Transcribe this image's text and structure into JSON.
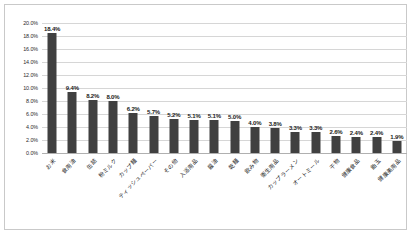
{
  "chart_data": {
    "type": "bar",
    "title": "",
    "subtitle": "",
    "xlabel": "",
    "ylabel": "",
    "ylim": [
      0,
      20
    ],
    "grid": true,
    "legend": false,
    "legend_position": "none",
    "bar_color": "#404040",
    "gridline_color": "#d6d6d6",
    "border_color": "#c9c9c9",
    "value_suffix": "%",
    "categories": [
      "お米",
      "食用油",
      "缶詰",
      "粉ミルク",
      "カップ麺",
      "ティッシュペーパー",
      "その他",
      "入浴用品",
      "醤油",
      "乾麺",
      "飲み物",
      "衛生用品",
      "カップラーメン",
      "オートミール",
      "干物",
      "健康食品",
      "飴玉",
      "健康美用品"
    ],
    "values": [
      18.4,
      9.4,
      8.2,
      8.0,
      6.2,
      5.7,
      5.2,
      5.1,
      5.1,
      5.0,
      4.0,
      3.8,
      3.3,
      3.3,
      2.6,
      2.4,
      2.4,
      1.9
    ],
    "value_labels": [
      "18.4%",
      "9.4%",
      "8.2%",
      "8.0%",
      "6.2%",
      "5.7%",
      "5.2%",
      "5.1%",
      "5.1%",
      "5.0%",
      "4.0%",
      "3.8%",
      "3.3%",
      "3.3%",
      "2.6%",
      "2.4%",
      "2.4%",
      "1.9%"
    ],
    "y_ticks": [
      0,
      2,
      4,
      6,
      8,
      10,
      12,
      14,
      16,
      18,
      20
    ],
    "y_tick_labels": [
      "0.0%",
      "2.0%",
      "4.0%",
      "6.0%",
      "8.0%",
      "10.0%",
      "12.0%",
      "14.0%",
      "16.0%",
      "18.0%",
      "20.0%"
    ]
  }
}
